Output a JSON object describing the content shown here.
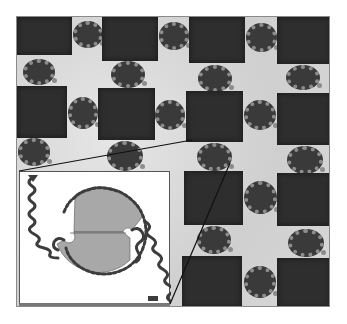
{
  "figure": {
    "colors": {
      "background": "#ffffff",
      "substrate": "#d9d9d9",
      "dark_square": "#2e2e2e",
      "cell_core": "#3a3a3a",
      "cell_rim": "#8c8c8c",
      "inset_disk": "#a8a8a8",
      "inset_chain": "#3c3c3c",
      "connector_line": "#111111"
    },
    "grid": {
      "columns": 4,
      "rows": 4,
      "squares": [
        {
          "x": 16,
          "y": 16,
          "w": 55,
          "h": 38
        },
        {
          "x": 101,
          "y": 16,
          "w": 56,
          "h": 44
        },
        {
          "x": 188,
          "y": 16,
          "w": 56,
          "h": 46
        },
        {
          "x": 276,
          "y": 16,
          "w": 54,
          "h": 47
        },
        {
          "x": 16,
          "y": 85,
          "w": 50,
          "h": 52
        },
        {
          "x": 97,
          "y": 87,
          "w": 57,
          "h": 52
        },
        {
          "x": 185,
          "y": 90,
          "w": 57,
          "h": 51
        },
        {
          "x": 276,
          "y": 92,
          "w": 54,
          "h": 52
        },
        {
          "x": 183,
          "y": 170,
          "w": 59,
          "h": 54
        },
        {
          "x": 276,
          "y": 172,
          "w": 54,
          "h": 53
        },
        {
          "x": 181,
          "y": 255,
          "w": 60,
          "h": 52
        },
        {
          "x": 276,
          "y": 257,
          "w": 54,
          "h": 50
        }
      ],
      "cells": [
        {
          "x": 72,
          "y": 20,
          "w": 30,
          "h": 27
        },
        {
          "x": 158,
          "y": 21,
          "w": 30,
          "h": 28
        },
        {
          "x": 245,
          "y": 22,
          "w": 31,
          "h": 29
        },
        {
          "x": 22,
          "y": 58,
          "w": 32,
          "h": 26
        },
        {
          "x": 110,
          "y": 60,
          "w": 34,
          "h": 27
        },
        {
          "x": 197,
          "y": 64,
          "w": 34,
          "h": 27
        },
        {
          "x": 285,
          "y": 64,
          "w": 34,
          "h": 25
        },
        {
          "x": 67,
          "y": 96,
          "w": 30,
          "h": 32
        },
        {
          "x": 154,
          "y": 99,
          "w": 30,
          "h": 30
        },
        {
          "x": 243,
          "y": 99,
          "w": 32,
          "h": 30
        },
        {
          "x": 17,
          "y": 137,
          "w": 32,
          "h": 28
        },
        {
          "x": 106,
          "y": 140,
          "w": 36,
          "h": 30
        },
        {
          "x": 196,
          "y": 142,
          "w": 35,
          "h": 28
        },
        {
          "x": 286,
          "y": 145,
          "w": 36,
          "h": 28
        },
        {
          "x": 243,
          "y": 180,
          "w": 33,
          "h": 33
        },
        {
          "x": 196,
          "y": 225,
          "w": 34,
          "h": 28
        },
        {
          "x": 287,
          "y": 228,
          "w": 36,
          "h": 28
        },
        {
          "x": 243,
          "y": 265,
          "w": 32,
          "h": 32
        }
      ]
    },
    "inset": {
      "label": "",
      "box": {
        "x": 19,
        "y": 171,
        "w": 151,
        "h": 133
      }
    },
    "connectors": [
      {
        "from": [
          19,
          171
        ],
        "to": [
          192,
          140
        ]
      },
      {
        "from": [
          170,
          304
        ],
        "to": [
          230,
          163
        ]
      }
    ]
  }
}
